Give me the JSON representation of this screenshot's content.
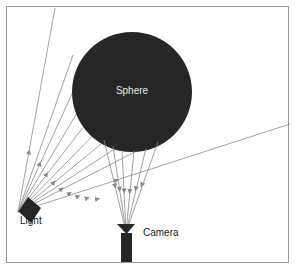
{
  "figure": {
    "background_color": "#ffffff",
    "border_color": "#9a9a9a",
    "ray_color": "#8a8a8a",
    "shape_color": "#262626",
    "label_color": "#1a1a1a",
    "label_on_dark_color": "#e8e8e8"
  },
  "labels": {
    "sphere": "Sphere",
    "light": "Light",
    "camera": "Camera"
  },
  "objects": {
    "sphere": {
      "name": "Sphere",
      "center_x": 132,
      "center_y": 92,
      "radius": 60,
      "fill": "#262626"
    },
    "light": {
      "name": "Light",
      "apex_x": 18,
      "apex_y": 212,
      "fill": "#262626"
    },
    "camera": {
      "name": "Camera",
      "apex_x": 126,
      "apex_y": 232,
      "fill": "#262626"
    }
  },
  "rays": {
    "incident_count": 10,
    "reflected_count": 6,
    "arrowheads": true,
    "incident_endpoints": [
      [
        55,
        8
      ],
      [
        73,
        55
      ],
      [
        82,
        72
      ],
      [
        93,
        86
      ],
      [
        104,
        100
      ],
      [
        116,
        112
      ],
      [
        128,
        122
      ],
      [
        142,
        131
      ],
      [
        160,
        139
      ],
      [
        290,
        124
      ]
    ],
    "reflected_origins": [
      [
        104,
        140
      ],
      [
        113,
        146
      ],
      [
        122,
        150
      ],
      [
        134,
        151
      ],
      [
        146,
        148
      ],
      [
        158,
        142
      ]
    ]
  }
}
